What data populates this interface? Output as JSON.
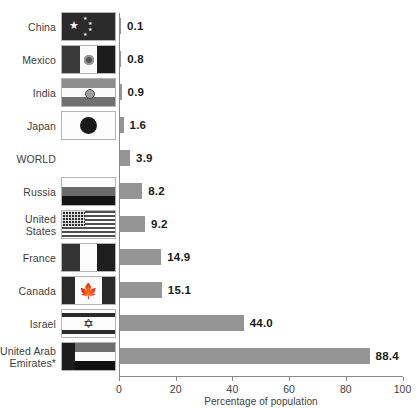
{
  "chart_data": {
    "type": "bar",
    "orientation": "horizontal",
    "title": "",
    "xlabel": "Percentage of population",
    "ylabel": "",
    "xlim": [
      0,
      100
    ],
    "xticks": [
      0,
      20,
      40,
      60,
      80,
      100
    ],
    "grid": false,
    "legend": null,
    "bar_color": "#959595",
    "axis_color": "#8a8a8a",
    "label_color": "#3d3d3d",
    "value_color": "#1a1a1a",
    "footnote_marker": "*",
    "categories": [
      "China",
      "Mexico",
      "India",
      "Japan",
      "WORLD",
      "Russia",
      "United States",
      "France",
      "Canada",
      "Israel",
      "United Arab Emirates*"
    ],
    "values": [
      0.1,
      0.8,
      0.9,
      1.6,
      3.9,
      8.2,
      9.2,
      14.9,
      15.1,
      44.0,
      88.4
    ],
    "value_labels": [
      "0.1",
      "0.8",
      "0.9",
      "1.6",
      "3.9",
      "8.2",
      "9.2",
      "14.9",
      "15.1",
      "44.0",
      "88.4"
    ]
  },
  "rows": [
    {
      "label": "China",
      "value_label": "0.1",
      "value": 0.1,
      "flag": "flag-china",
      "flag_name": "flag-china",
      "has_flag": true
    },
    {
      "label": "Mexico",
      "value_label": "0.8",
      "value": 0.8,
      "flag": "flag-mexico",
      "flag_name": "flag-mexico",
      "has_flag": true
    },
    {
      "label": "India",
      "value_label": "0.9",
      "value": 0.9,
      "flag": "flag-india",
      "flag_name": "flag-india",
      "has_flag": true
    },
    {
      "label": "Japan",
      "value_label": "1.6",
      "value": 1.6,
      "flag": "flag-japan",
      "flag_name": "flag-japan",
      "has_flag": true
    },
    {
      "label": "WORLD",
      "value_label": "3.9",
      "value": 3.9,
      "flag": "",
      "flag_name": "",
      "has_flag": false
    },
    {
      "label": "Russia",
      "value_label": "8.2",
      "value": 8.2,
      "flag": "flag-russia",
      "flag_name": "flag-russia",
      "has_flag": true
    },
    {
      "label": "United\nStates",
      "value_label": "9.2",
      "value": 9.2,
      "flag": "flag-usa",
      "flag_name": "flag-united-states",
      "has_flag": true
    },
    {
      "label": "France",
      "value_label": "14.9",
      "value": 14.9,
      "flag": "flag-france",
      "flag_name": "flag-france",
      "has_flag": true
    },
    {
      "label": "Canada",
      "value_label": "15.1",
      "value": 15.1,
      "flag": "flag-canada",
      "flag_name": "flag-canada",
      "has_flag": true
    },
    {
      "label": "Israel",
      "value_label": "44.0",
      "value": 44.0,
      "flag": "flag-israel",
      "flag_name": "flag-israel",
      "has_flag": true
    },
    {
      "label": "United Arab\nEmirates*",
      "value_label": "88.4",
      "value": 88.4,
      "flag": "flag-uae",
      "flag_name": "flag-united-arab-emirates",
      "has_flag": true
    }
  ],
  "x_axis": {
    "title": "Percentage of population",
    "ticks": [
      "0",
      "20",
      "40",
      "60",
      "80",
      "100"
    ]
  }
}
